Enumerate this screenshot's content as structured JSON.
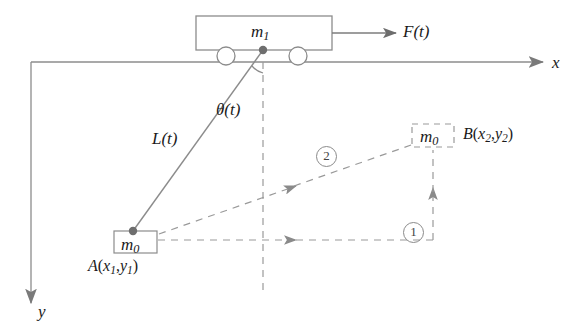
{
  "figure": {
    "type": "physics-schematic",
    "colors": {
      "line": "#7d7d7d",
      "dashed": "#9a9a9a",
      "text": "#1a1a1a",
      "dot": "#6e6e6e",
      "background": "#ffffff"
    },
    "axes": {
      "x_label": "x",
      "y_label": "y",
      "origin": {
        "x": 31,
        "y": 62
      }
    },
    "cart": {
      "mass_label": "m",
      "mass_sub": "1",
      "force_label": "F(t)",
      "wheels": 2
    },
    "pendulum": {
      "length_label": "L(t)",
      "angle_label": "θ(t)",
      "bob_mass_label": "m",
      "bob_mass_sub": "0"
    },
    "points": {
      "a": {
        "name": "A",
        "coords": "(x₁,y₁)",
        "letter": "A",
        "open_paren": "(",
        "x_sym": "x",
        "x_sub": "1",
        "comma": ",",
        "y_sym": "y",
        "y_sub": "1",
        "close_paren": ")",
        "mass_label": "m",
        "mass_sub": "0"
      },
      "b": {
        "name": "B",
        "coords": "(x₂,y₂)",
        "letter": "B",
        "open_paren": "(",
        "x_sym": "x",
        "x_sub": "2",
        "comma": ",",
        "y_sym": "y",
        "y_sub": "2",
        "close_paren": ")",
        "mass_label": "m",
        "mass_sub": "0"
      }
    },
    "steps": [
      {
        "id": "1",
        "label": "①",
        "text": "1",
        "description": "horizontal then vertical path"
      },
      {
        "id": "2",
        "label": "②",
        "text": "2",
        "description": "direct diagonal path"
      }
    ]
  }
}
